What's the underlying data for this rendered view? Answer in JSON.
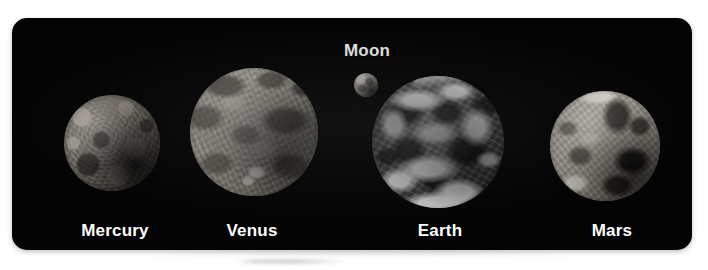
{
  "figure": {
    "background_color": "#ffffff",
    "panel_color": "#040404",
    "label_color": "#ffffff"
  },
  "bodies": [
    {
      "name": "Mercury",
      "label": "Mercury",
      "icon": "planet-mercury-icon",
      "label_position": "below"
    },
    {
      "name": "Venus",
      "label": "Venus",
      "icon": "planet-venus-icon",
      "label_position": "below"
    },
    {
      "name": "Moon",
      "label": "Moon",
      "icon": "moon-icon",
      "label_position": "above"
    },
    {
      "name": "Earth",
      "label": "Earth",
      "icon": "planet-earth-icon",
      "label_position": "below"
    },
    {
      "name": "Mars",
      "label": "Mars",
      "icon": "planet-mars-icon",
      "label_position": "below"
    }
  ]
}
